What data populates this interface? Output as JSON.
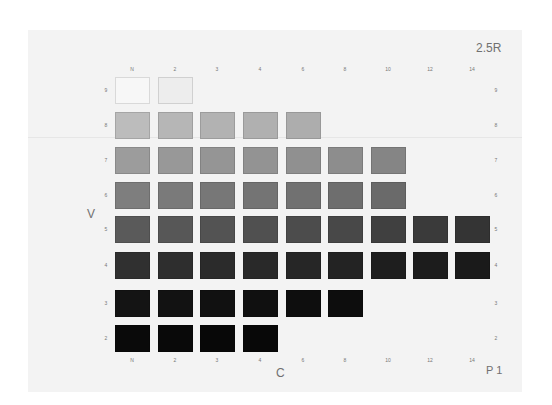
{
  "chart": {
    "hue_label": "2.5R",
    "plate_label": "P 1",
    "value_axis_label": "V",
    "chroma_axis_label": "C"
  },
  "chroma_labels": [
    "N",
    "2",
    "3",
    "4",
    "6",
    "8",
    "10",
    "12",
    "14"
  ],
  "value_labels": [
    "9",
    "8",
    "7",
    "6",
    "5",
    "4",
    "3",
    "2"
  ],
  "chart_data": {
    "type": "heatmap",
    "title": "2.5R",
    "xlabel": "C",
    "ylabel": "V",
    "x": [
      "N",
      "2",
      "3",
      "4",
      "6",
      "8",
      "10",
      "12",
      "14"
    ],
    "y": [
      9,
      8,
      7,
      6,
      5,
      4,
      3,
      2
    ],
    "available_chips": {
      "9": [
        "N",
        "2"
      ],
      "8": [
        "N",
        "2",
        "3",
        "4",
        "6"
      ],
      "7": [
        "N",
        "2",
        "3",
        "4",
        "6",
        "8",
        "10"
      ],
      "6": [
        "N",
        "2",
        "3",
        "4",
        "6",
        "8",
        "10"
      ],
      "5": [
        "N",
        "2",
        "3",
        "4",
        "6",
        "8",
        "10",
        "12",
        "14"
      ],
      "4": [
        "N",
        "2",
        "3",
        "4",
        "6",
        "8",
        "10",
        "12",
        "14"
      ],
      "3": [
        "N",
        "2",
        "3",
        "4",
        "6",
        "8"
      ],
      "2": [
        "N",
        "2",
        "3",
        "4"
      ]
    },
    "annotations": [
      "P 1"
    ]
  },
  "colors": {
    "9": [
      "#f7f7f7",
      "#ededed"
    ],
    "8": [
      "#bcbcbc",
      "#b6b6b6",
      "#b2b2b2",
      "#b0b0b0",
      "#adadad"
    ],
    "7": [
      "#9c9c9c",
      "#989898",
      "#959595",
      "#939393",
      "#909090",
      "#8d8d8d",
      "#858585"
    ],
    "6": [
      "#7e7e7e",
      "#7a7a7a",
      "#777777",
      "#747474",
      "#717171",
      "#6e6e6e",
      "#6a6a6a"
    ],
    "5": [
      "#5a5a5a",
      "#575757",
      "#535353",
      "#505050",
      "#4c4c4c",
      "#484848",
      "#404040",
      "#3a3a3a",
      "#343434"
    ],
    "4": [
      "#303030",
      "#2e2e2e",
      "#2b2b2b",
      "#292929",
      "#262626",
      "#232323",
      "#1e1e1e",
      "#1c1c1c",
      "#1a1a1a"
    ],
    "3": [
      "#141414",
      "#121212",
      "#111111",
      "#101010",
      "#0e0e0e",
      "#0d0d0d"
    ],
    "2": [
      "#0a0a0a",
      "#090909",
      "#080808",
      "#080808"
    ]
  }
}
